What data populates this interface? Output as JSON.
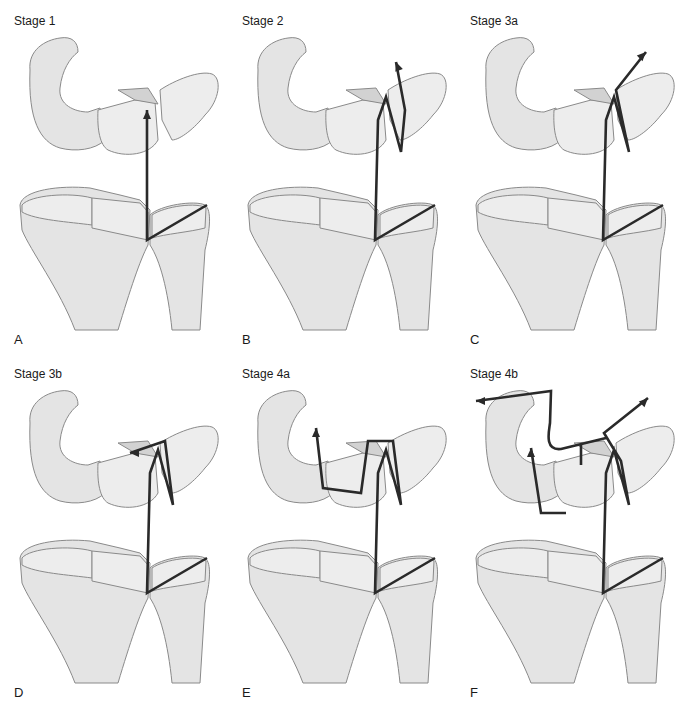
{
  "figure": {
    "colors": {
      "bone_fill": "#e4e4e4",
      "bone_outline": "#8a8a8a",
      "arrow": "#2a2a2a",
      "background": "#ffffff"
    },
    "panels": [
      {
        "letter": "A",
        "title": "Stage 1",
        "col": 0,
        "row": 0,
        "path": "M207,205 L147,240 L147,110",
        "arrows": [
          [
            147,
            110,
            "up"
          ]
        ]
      },
      {
        "letter": "B",
        "title": "Stage 2",
        "col": 1,
        "row": 0,
        "path": "M207,205 L147,240 L150,120 L158,97 L173,152 L177,110 L168,62",
        "arrows": [
          [
            168,
            62,
            "upleft"
          ]
        ]
      },
      {
        "letter": "C",
        "title": "Stage 3a",
        "col": 2,
        "row": 0,
        "path": "M207,205 L147,240 L150,120 L158,97 L173,152 L160,90 L190,52",
        "arrows": [
          [
            190,
            52,
            "upright"
          ]
        ]
      },
      {
        "letter": "D",
        "title": "Stage 3b",
        "col": 0,
        "row": 1,
        "path": "M207,205 L147,240 L150,120 L158,97 L173,152 L165,88 L130,100",
        "arrows": [
          [
            130,
            100,
            "left"
          ]
        ]
      },
      {
        "letter": "E",
        "title": "Stage 4a",
        "col": 1,
        "row": 1,
        "path": "M207,205 L147,240 L150,120 L158,97 L173,152 L165,88 L140,88 L133,140 L95,135 L88,75",
        "arrows": [
          [
            88,
            75,
            "up"
          ]
        ]
      },
      {
        "letter": "F",
        "title": "Stage 4b",
        "col": 2,
        "row": 1,
        "path": "M207,205 L147,240 L150,120 L158,97 L173,152 L165,108 L148,80 L192,45 M150,85 L105,96 C88,98 93,78 94,70 L95,38 L20,48 M125,90 L125,112 M110,160 L85,160 L75,95",
        "arrows": [
          [
            192,
            45,
            "upright"
          ],
          [
            20,
            48,
            "left"
          ],
          [
            75,
            95,
            "up"
          ]
        ]
      }
    ]
  }
}
